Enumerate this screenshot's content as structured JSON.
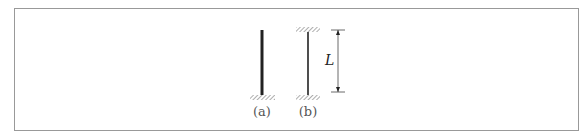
{
  "figure": {
    "columns": [
      {
        "id": "a",
        "label": "(a)",
        "support": "fixed-base, free-top"
      },
      {
        "id": "b",
        "label": "(b)",
        "support": "fixed-base, fixed-top"
      }
    ],
    "dimension": {
      "symbol": "L"
    }
  },
  "colors": {
    "frame": "#999999",
    "line": "#222222",
    "hatch": "#888888"
  }
}
